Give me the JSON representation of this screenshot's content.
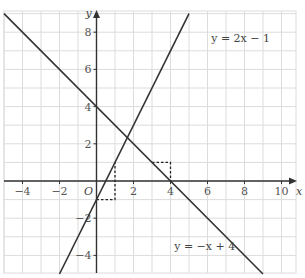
{
  "chart_data": {
    "type": "line",
    "title": "",
    "xlabel": "x",
    "ylabel": "y",
    "origin_label": "O",
    "xlim": [
      -5,
      11
    ],
    "ylim": [
      -5,
      9
    ],
    "grid": true,
    "x_ticks": [
      -4,
      -2,
      2,
      4,
      6,
      8,
      10
    ],
    "y_ticks": [
      -4,
      -2,
      2,
      4,
      6,
      8
    ],
    "x_tick_labels": [
      "−4",
      "−2",
      "2",
      "4",
      "6",
      "8",
      "10"
    ],
    "y_tick_labels": [
      "−4",
      "−2",
      "2",
      "4",
      "6",
      "8"
    ],
    "series": [
      {
        "name": "y = 2x − 1",
        "equation": "y = 2x - 1",
        "slope": 2,
        "intercept": -1,
        "x": [
          -2,
          5
        ],
        "y": [
          -5,
          9
        ],
        "label_position": [
          6.2,
          7.5
        ]
      },
      {
        "name": "y = −x + 4",
        "equation": "y = -x + 4",
        "slope": -1,
        "intercept": 4,
        "x": [
          -5,
          9
        ],
        "y": [
          9,
          -5
        ],
        "label_position": [
          4.2,
          -3.7
        ]
      }
    ],
    "annotations": [
      {
        "type": "slope-triangle",
        "line": "y = 2x − 1",
        "points": [
          [
            0,
            -1
          ],
          [
            1,
            -1
          ],
          [
            1,
            1
          ]
        ],
        "style": "dashed"
      },
      {
        "type": "slope-triangle",
        "line": "y = −x + 4",
        "points": [
          [
            3,
            1
          ],
          [
            4,
            1
          ],
          [
            4,
            0
          ]
        ],
        "style": "dashed"
      }
    ],
    "colors": {
      "line": "#333333",
      "axis": "#333333",
      "grid": "#dcdcdc",
      "text": "#555555"
    }
  }
}
